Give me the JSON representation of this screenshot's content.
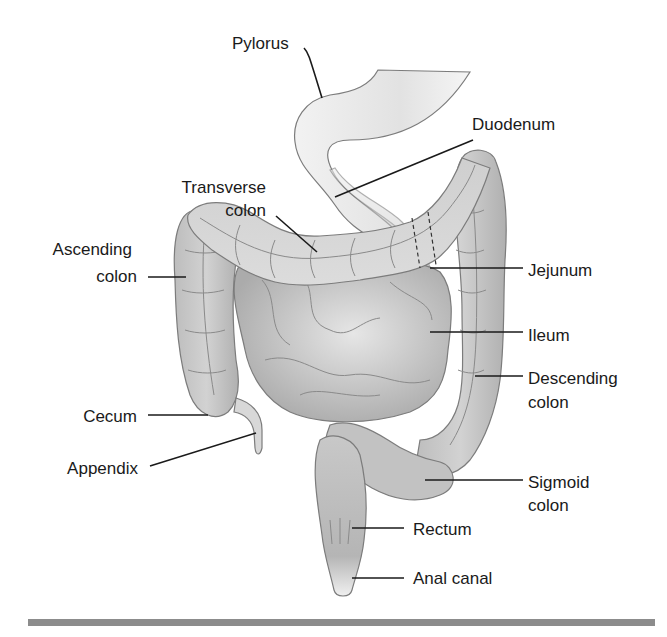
{
  "diagram": {
    "labels": [
      {
        "id": "pylorus",
        "text": "Pylorus"
      },
      {
        "id": "duodenum",
        "text": "Duodenum"
      },
      {
        "id": "transverse_colon",
        "lines": [
          "Transverse",
          "colon"
        ]
      },
      {
        "id": "ascending_colon",
        "lines": [
          "Ascending",
          "colon"
        ]
      },
      {
        "id": "jejunum",
        "text": "Jejunum"
      },
      {
        "id": "ileum",
        "text": "Ileum"
      },
      {
        "id": "descending_colon",
        "lines": [
          "Descending",
          "colon"
        ]
      },
      {
        "id": "cecum",
        "text": "Cecum"
      },
      {
        "id": "appendix",
        "text": "Appendix"
      },
      {
        "id": "sigmoid_colon",
        "lines": [
          "Sigmoid",
          "colon"
        ]
      },
      {
        "id": "rectum",
        "text": "Rectum"
      },
      {
        "id": "anal_canal",
        "text": "Anal canal"
      }
    ],
    "colors": {
      "organ_light": "#e6e6e6",
      "organ_mid": "#c4c4c4",
      "organ_dark": "#a6a6a6",
      "text": "#1a1a1a",
      "rule": "#8c8c8c"
    }
  }
}
